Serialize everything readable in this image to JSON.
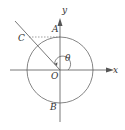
{
  "diagram": {
    "type": "unit-circle-angle",
    "labels": {
      "x_axis": "x",
      "y_axis": "y",
      "origin": "O",
      "point_A": "A",
      "point_B": "B",
      "point_C": "C",
      "angle": "θ"
    },
    "colors": {
      "stroke": "#555555",
      "dashed": "#777777",
      "text": "#333333"
    }
  }
}
